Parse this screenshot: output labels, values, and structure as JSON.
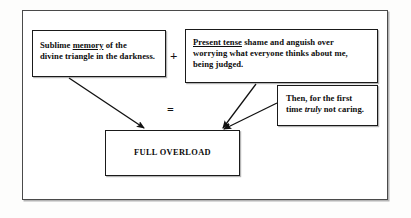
{
  "diagram": {
    "title_visible": false,
    "background_color": "#fdfdfc",
    "frame_color": "#4a4a4a",
    "box_border_color": "#1a1a1a",
    "text_color": "#0d0d0d",
    "boxes": {
      "memory": {
        "underlined": "memory",
        "line1_before": "Sublime ",
        "line1_after": " of the",
        "line2": "divine triangle in the darkness."
      },
      "present": {
        "underlined": "Present tense",
        "line1_after": " shame and anguish over",
        "line2": "worrying what everyone thinks about me,",
        "line3": "being judged."
      },
      "then": {
        "line1": "Then, for the first",
        "line2_before": "time ",
        "italic": "truly",
        "line2_after": " not caring."
      },
      "overload": {
        "label": "FULL OVERLOAD"
      }
    },
    "operators": {
      "plus": "+",
      "equals": "="
    },
    "arrows": [
      {
        "name": "memory-to-overload",
        "from": "memory",
        "to": "overload",
        "x1": 69,
        "y1": 78,
        "x2": 144,
        "y2": 128
      },
      {
        "name": "present-to-overload",
        "from": "present",
        "to": "overload",
        "x1": 256,
        "y1": 84,
        "x2": 223,
        "y2": 128
      },
      {
        "name": "then-to-overload",
        "from": "then",
        "to": "overload",
        "x1": 277,
        "y1": 103,
        "x2": 224,
        "y2": 129
      }
    ]
  }
}
